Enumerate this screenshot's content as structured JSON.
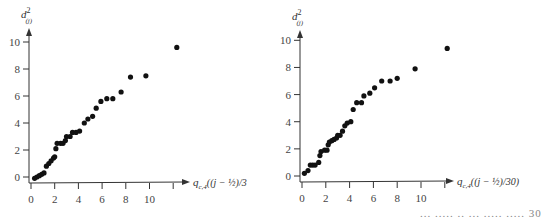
{
  "chart_data": [
    {
      "type": "scatter",
      "title": "",
      "xlabel": "q_{c,4}((j - 1/2)/30)",
      "xlabel_display": "q",
      "xlabel_sub": "c,4",
      "xlabel_rest": "((j − ½)/3",
      "ylabel": "d²_(j)",
      "ylabel_base": "d",
      "ylabel_sup": "2",
      "ylabel_sub": "(j)",
      "xlim": [
        0,
        12.5
      ],
      "ylim": [
        0,
        10.5
      ],
      "x_ticks": [
        0,
        2,
        4,
        6,
        8,
        10,
        12
      ],
      "x_tick_labels": [
        "0",
        "2",
        "4",
        "6",
        "8",
        "10",
        ""
      ],
      "y_ticks": [
        0,
        2,
        4,
        6,
        8,
        10
      ],
      "y_tick_labels": [
        "0",
        "2",
        "4",
        "6",
        "8",
        "10"
      ],
      "grid": false,
      "legend": null,
      "points": [
        [
          0.3,
          -0.1
        ],
        [
          0.5,
          0.0
        ],
        [
          0.7,
          0.1
        ],
        [
          0.9,
          0.2
        ],
        [
          1.1,
          0.3
        ],
        [
          1.3,
          0.8
        ],
        [
          1.5,
          1.0
        ],
        [
          1.7,
          1.2
        ],
        [
          1.9,
          1.4
        ],
        [
          2.0,
          1.5
        ],
        [
          2.1,
          2.1
        ],
        [
          2.2,
          2.5
        ],
        [
          2.5,
          2.5
        ],
        [
          2.7,
          2.5
        ],
        [
          2.9,
          2.7
        ],
        [
          3.0,
          3.0
        ],
        [
          3.3,
          3.0
        ],
        [
          3.5,
          3.3
        ],
        [
          3.8,
          3.3
        ],
        [
          4.1,
          3.4
        ],
        [
          4.5,
          4.0
        ],
        [
          4.8,
          4.3
        ],
        [
          5.2,
          4.5
        ],
        [
          5.5,
          5.1
        ],
        [
          5.9,
          5.6
        ],
        [
          6.4,
          5.8
        ],
        [
          6.9,
          5.8
        ],
        [
          7.6,
          6.3
        ],
        [
          8.4,
          7.4
        ],
        [
          9.7,
          7.5
        ],
        [
          12.3,
          9.6
        ]
      ]
    },
    {
      "type": "scatter",
      "title": "",
      "xlabel": "q_{c,4}((j - 1/2)/30)",
      "xlabel_display": "q",
      "xlabel_sub": "c,4",
      "xlabel_rest": "((j − ½)/30)",
      "ylabel": "d²_(j)",
      "ylabel_base": "d",
      "ylabel_sup": "2",
      "ylabel_sub": "(j)",
      "xlim": [
        0,
        12.5
      ],
      "ylim": [
        0,
        10.5
      ],
      "x_ticks": [
        0,
        2,
        4,
        6,
        8,
        10,
        12
      ],
      "x_tick_labels": [
        "0",
        "2",
        "4",
        "6",
        "8",
        "10",
        ""
      ],
      "y_ticks": [
        0,
        2,
        4,
        6,
        8,
        10
      ],
      "y_tick_labels": [
        "0",
        "2",
        "4",
        "6",
        "8",
        "10"
      ],
      "grid": false,
      "legend": null,
      "points": [
        [
          0.2,
          0.2
        ],
        [
          0.5,
          0.4
        ],
        [
          0.7,
          0.8
        ],
        [
          0.9,
          0.8
        ],
        [
          1.1,
          0.8
        ],
        [
          1.4,
          1.0
        ],
        [
          1.5,
          1.5
        ],
        [
          1.6,
          1.8
        ],
        [
          1.9,
          1.9
        ],
        [
          2.1,
          1.9
        ],
        [
          2.2,
          2.3
        ],
        [
          2.3,
          2.5
        ],
        [
          2.5,
          2.6
        ],
        [
          2.7,
          2.7
        ],
        [
          2.9,
          2.8
        ],
        [
          3.0,
          3.0
        ],
        [
          3.2,
          3.0
        ],
        [
          3.4,
          3.3
        ],
        [
          3.6,
          3.7
        ],
        [
          3.8,
          3.9
        ],
        [
          4.1,
          4.0
        ],
        [
          4.3,
          4.9
        ],
        [
          4.6,
          5.4
        ],
        [
          5.0,
          5.4
        ],
        [
          5.2,
          5.9
        ],
        [
          5.7,
          6.1
        ],
        [
          6.1,
          6.5
        ],
        [
          6.7,
          7.0
        ],
        [
          7.4,
          7.0
        ],
        [
          8.0,
          7.2
        ],
        [
          9.5,
          7.9
        ],
        [
          12.2,
          9.4
        ]
      ]
    }
  ],
  "panels": [
    {
      "left": 0,
      "origin_x": 31,
      "origin_y": 177,
      "x_unit": 11.85,
      "y_unit": 13.5,
      "axis_y": 183,
      "xaxis_end": 190,
      "yaxis_top": 28,
      "label_x": 193
    },
    {
      "left": 263,
      "origin_x": 39,
      "origin_y": 176,
      "x_unit": 11.9,
      "y_unit": 13.57,
      "axis_y": 182,
      "xaxis_end": 191,
      "yaxis_top": 30,
      "label_x": 194
    }
  ],
  "footer_fragment": "...   .....   ..  ... .....  ..... 30",
  "style": {
    "point_color": "#111111",
    "axis_color": "#333333"
  }
}
